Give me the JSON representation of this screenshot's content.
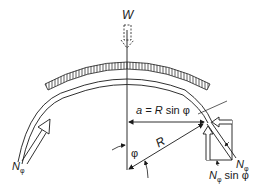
{
  "figure": {
    "load_label": "W",
    "span_label_prefix": "a = ",
    "span_label_R": "R",
    "span_label_suffix": " sin φ",
    "radius_label": "R",
    "angle_label": "φ",
    "meridional_force_left": {
      "main": "N",
      "sub": "φ"
    },
    "meridional_force_right": {
      "main": "N",
      "sub": "φ"
    },
    "vertical_component": {
      "main": "N",
      "sub": "φ",
      "suffix": " sin φ"
    },
    "colors": {
      "line": "#1a1a1a",
      "background": "#ffffff"
    }
  }
}
